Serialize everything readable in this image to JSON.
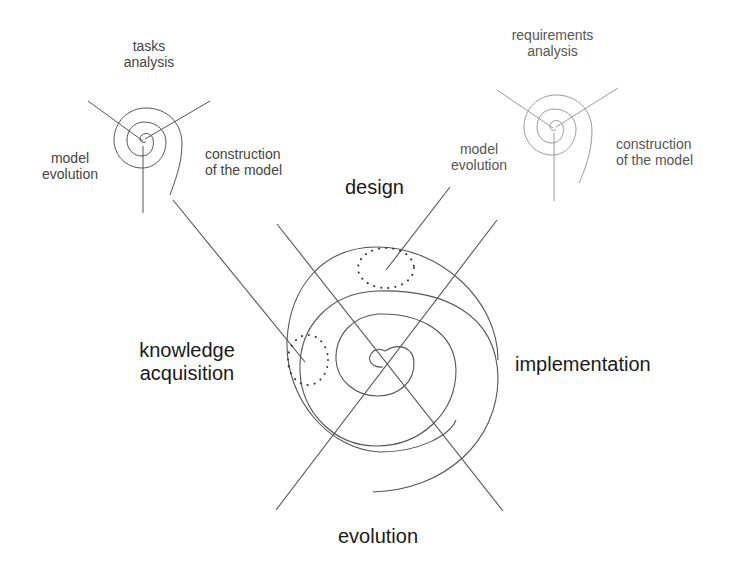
{
  "diagram": {
    "main_spiral": {
      "phases": {
        "design": "design",
        "implementation": "implementation",
        "evolution": "evolution",
        "knowledge_acquisition_line1": "knowledge",
        "knowledge_acquisition_line2": "acquisition"
      }
    },
    "mini_spiral_left": {
      "top_line1": "tasks",
      "top_line2": "analysis",
      "left_line1": "model",
      "left_line2": "evolution",
      "right_line1": "construction",
      "right_line2": "of the model"
    },
    "mini_spiral_right": {
      "top_line1": "requirements",
      "top_line2": "analysis",
      "left_line1": "model",
      "left_line2": "evolution",
      "right_line1": "construction",
      "right_line2": "of the model"
    },
    "colors": {
      "line": "#555555",
      "line_light": "#9a9a9a",
      "text": "#1a1a1a",
      "dots": "#333333"
    }
  }
}
